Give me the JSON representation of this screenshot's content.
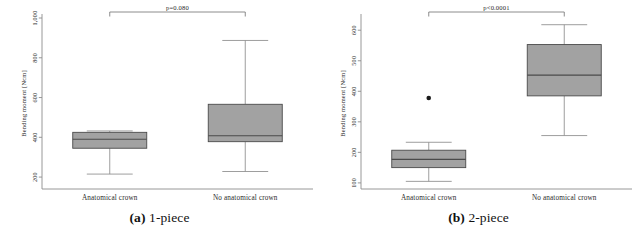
{
  "figure": {
    "name": "boxplot-figure-bending-moment",
    "panels": [
      {
        "id": "a",
        "caption_label": "(a)",
        "caption_text": "1-piece",
        "chart_data": {
          "type": "box",
          "title": "",
          "xlabel": "",
          "ylabel": "Bending moment [Ncm]",
          "categories": [
            "Anatomical crown",
            "No anatomical crown"
          ],
          "ylim": [
            140,
            1000
          ],
          "yticks": [
            200,
            400,
            600,
            800,
            1000
          ],
          "ytick_labels": [
            "200",
            "400",
            "600",
            "800",
            "1,000"
          ],
          "grid": false,
          "annotation": "p=0.080",
          "boxes": [
            {
              "category": "Anatomical crown",
              "whisker_low": 215,
              "q1": 345,
              "median": 390,
              "q3": 425,
              "whisker_high": 432,
              "outliers": []
            },
            {
              "category": "No anatomical crown",
              "whisker_low": 228,
              "q1": 378,
              "median": 408,
              "q3": 566,
              "whisker_high": 887,
              "outliers": []
            }
          ]
        }
      },
      {
        "id": "b",
        "caption_label": "(b)",
        "caption_text": "2-piece",
        "chart_data": {
          "type": "box",
          "title": "",
          "xlabel": "",
          "ylabel": "Bending moment [Ncm]",
          "categories": [
            "Anatomical crown",
            "No anatomical crown"
          ],
          "ylim": [
            80,
            640
          ],
          "yticks": [
            100,
            200,
            300,
            400,
            500,
            600
          ],
          "ytick_labels": [
            "100",
            "200",
            "300",
            "400",
            "500",
            "600"
          ],
          "grid": false,
          "annotation": "p<0.0001",
          "boxes": [
            {
              "category": "Anatomical crown",
              "whisker_low": 105,
              "q1": 150,
              "median": 177,
              "q3": 207,
              "whisker_high": 233,
              "outliers": [
                378
              ]
            },
            {
              "category": "No anatomical crown",
              "whisker_low": 255,
              "q1": 385,
              "median": 453,
              "q3": 553,
              "whisker_high": 618,
              "outliers": []
            }
          ]
        }
      }
    ],
    "style": {
      "box_fill": "#a2a2a2",
      "box_stroke": "#4a4a4a",
      "axis_color": "#8c8c8c",
      "whisker_color": "#8c8c8c",
      "bracket_color": "#6e6e6e",
      "outlier_color": "#1a1a1a",
      "background": "#ffffff"
    }
  }
}
